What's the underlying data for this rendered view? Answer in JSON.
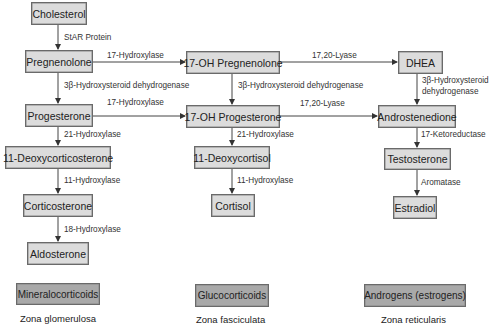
{
  "nodes": {
    "cholesterol": "Cholesterol",
    "pregnenolone": "Pregnenolone",
    "oh17_pregnenolone": "17-OH Pregnenolone",
    "dhea": "DHEA",
    "progesterone": "Progesterone",
    "oh17_progesterone": "17-OH Progesterone",
    "androstenedione": "Androstenedione",
    "deoxycorticosterone": "11-Deoxycorticosterone",
    "deoxycortisol": "11-Deoxycortisol",
    "testosterone": "Testosterone",
    "corticosterone": "Corticosterone",
    "cortisol": "Cortisol",
    "estradiol": "Estradiol",
    "aldosterone": "Aldosterone"
  },
  "enzymes": {
    "star": "StAR Protein",
    "h17_a": "17-Hydroxylase",
    "lyase_a": "17,20-Lyase",
    "hsd_a": "3β-Hydroxysteroid dehydrogenase",
    "hsd_b": "3β-Hydroxysteroid dehydrogenase",
    "hsd_c1": "3β-Hydroxysteroid",
    "hsd_c2": "dehydrogenase",
    "h17_b": "17-Hydroxylase",
    "lyase_b": "17,20-Lyase",
    "h21_a": "21-Hydroxylase",
    "h21_b": "21-Hydroxylase",
    "ketored": "17-Ketoreductase",
    "h11_a": "11-Hydroxylase",
    "h11_b": "11-Hydroxylase",
    "aromatase": "Aromatase",
    "h18": "18-Hydroxylase"
  },
  "categories": {
    "mineral": "Mineralocorticoids",
    "gluco": "Glucocorticoids",
    "andro": "Androgens (estrogens)"
  },
  "zones": {
    "glomerulosa": "Zona glomerulosa",
    "fasciculata": "Zona fasciculata",
    "reticularis": "Zona reticularis"
  }
}
